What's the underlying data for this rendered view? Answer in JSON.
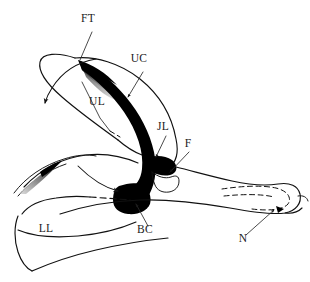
{
  "figure": {
    "background_color": "#ffffff",
    "ink_color": "#000000",
    "width": 310,
    "height": 282
  },
  "labels": [
    {
      "id": "ft",
      "text": "FT",
      "x": 88,
      "y": 22,
      "name": "label-ft"
    },
    {
      "id": "uc",
      "text": "UC",
      "x": 139,
      "y": 62,
      "name": "label-uc"
    },
    {
      "id": "ul",
      "text": "UL",
      "x": 97,
      "y": 105,
      "name": "label-ul"
    },
    {
      "id": "jl",
      "text": "JL",
      "x": 163,
      "y": 130,
      "name": "label-jl"
    },
    {
      "id": "f",
      "text": "F",
      "x": 188,
      "y": 147,
      "name": "label-f"
    },
    {
      "id": "bc",
      "text": "BC",
      "x": 145,
      "y": 233,
      "name": "label-bc"
    },
    {
      "id": "ll",
      "text": "LL",
      "x": 46,
      "y": 232,
      "name": "label-ll"
    },
    {
      "id": "n",
      "text": "N",
      "x": 243,
      "y": 242,
      "name": "label-n"
    }
  ],
  "legend_meaning": {
    "ft": "feather tract / tip",
    "uc": "upper cornified layer",
    "ul": "upper lamina",
    "jl": "junctional lamina",
    "f": "fold",
    "bc": "basal cushion",
    "ll": "lower lamina",
    "n": "notch"
  }
}
